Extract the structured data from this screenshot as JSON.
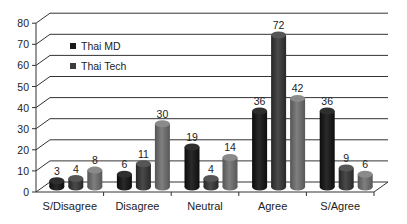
{
  "chart_data": {
    "type": "bar",
    "style": "3d-cylinder",
    "title": "",
    "xlabel": "",
    "ylabel": "",
    "ylim": [
      0,
      80
    ],
    "yticks": [
      0,
      10,
      20,
      30,
      40,
      50,
      60,
      70,
      80
    ],
    "grid": true,
    "legend_position": "upper-left-inside",
    "categories": [
      "S/Disagree",
      "Disagree",
      "Neutral",
      "Agree",
      "S/Agree"
    ],
    "series": [
      {
        "name": "Thai MD",
        "color": "#1a1a1a",
        "values": [
          3,
          6,
          19,
          36,
          36
        ]
      },
      {
        "name": "Thai Tech",
        "color": "#3c3c3c",
        "values": [
          4,
          11,
          4,
          72,
          9
        ]
      },
      {
        "name": "",
        "color": "#6e6e6e",
        "values": [
          8,
          30,
          14,
          42,
          6
        ]
      }
    ]
  },
  "legend": {
    "items": [
      {
        "label": "Thai MD",
        "color": "#1a1a1a"
      },
      {
        "label": "Thai Tech",
        "color": "#3c3c3c"
      }
    ]
  }
}
